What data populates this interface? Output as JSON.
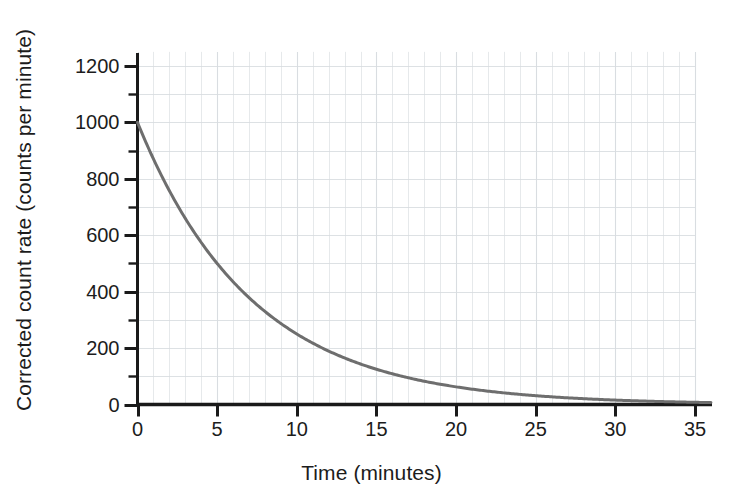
{
  "chart_data": {
    "type": "line",
    "title": "",
    "subtitle": "",
    "xlabel": "Time (minutes)",
    "ylabel": "Corrected count rate (counts per minute)",
    "xlim": [
      0,
      36
    ],
    "ylim": [
      0,
      1250
    ],
    "xticks": [
      0,
      5,
      10,
      15,
      20,
      25,
      30,
      35
    ],
    "xtick_labels": [
      "0",
      "5",
      "10",
      "15",
      "20",
      "25",
      "30",
      "35"
    ],
    "yticks": [
      0,
      200,
      400,
      600,
      800,
      1000,
      1200
    ],
    "ytick_labels": [
      "0",
      "200",
      "400",
      "600",
      "800",
      "1000",
      "1200"
    ],
    "y_minor_tick_step": 100,
    "x_minor_grid_step": 1,
    "y_minor_grid_step": 100,
    "grid": true,
    "grid_color": "#d8dce0",
    "legend": "none",
    "line_color": "#6e6e6e",
    "line_width": 3,
    "axis_color": "#1a1a1a",
    "series": [
      {
        "name": "Corrected count rate",
        "model": "exponential decay",
        "initial_value": 1000,
        "half_life_minutes": 5,
        "x": [
          0,
          1,
          2,
          3,
          4,
          5,
          6,
          7,
          8,
          9,
          10,
          11,
          12,
          13,
          14,
          15,
          16,
          17,
          18,
          19,
          20,
          21,
          22,
          23,
          24,
          25,
          26,
          27,
          28,
          29,
          30,
          31,
          32,
          33,
          34,
          35,
          36
        ],
        "values": [
          1000,
          871,
          758,
          660,
          574,
          500,
          435,
          379,
          330,
          287,
          250,
          218,
          189,
          165,
          144,
          125,
          109,
          95,
          83,
          72,
          63,
          54,
          47,
          41,
          36,
          31,
          27,
          24,
          21,
          18,
          16,
          14,
          12,
          10,
          9,
          8,
          7
        ]
      }
    ]
  }
}
